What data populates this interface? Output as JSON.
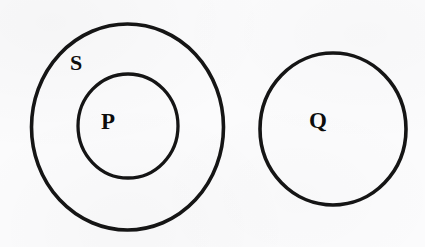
{
  "figure": {
    "kind": "euler-diagram",
    "background_color": "#fbfbfc",
    "stroke_color": "#151515",
    "label_color": "#0d0d0d",
    "width": 425,
    "height": 247
  },
  "sets": [
    {
      "id": "S",
      "label": "S",
      "role": "outer-enclosing-set",
      "label_x": 76,
      "label_y": 62,
      "cx": 127.5,
      "cy": 127,
      "rx": 96,
      "ry": 103,
      "stroke_width": 3.6
    },
    {
      "id": "P",
      "label": "P",
      "role": "inner-subset-of-S",
      "label_x": 108,
      "label_y": 121,
      "cx": 128,
      "cy": 126,
      "rx": 50,
      "ry": 52,
      "stroke_width": 3.3
    },
    {
      "id": "Q",
      "label": "Q",
      "role": "disjoint-set",
      "label_x": 318,
      "label_y": 120,
      "cx": 333,
      "cy": 129,
      "rx": 73,
      "ry": 76,
      "stroke_width": 3.6
    }
  ],
  "relations": [
    {
      "from": "P",
      "to": "S",
      "type": "subset"
    },
    {
      "from": "Q",
      "to": "S",
      "type": "disjoint"
    },
    {
      "from": "Q",
      "to": "P",
      "type": "disjoint"
    }
  ]
}
